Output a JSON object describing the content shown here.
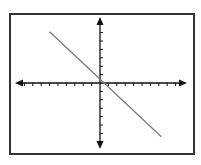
{
  "chart_data": {
    "type": "line",
    "title": "",
    "xlabel": "",
    "ylabel": "",
    "xlim": [
      -10,
      10
    ],
    "ylim": [
      -7.5,
      7.5
    ],
    "grid": false,
    "axes_style": "centered coordinate axes with arrowheads and unit tick marks",
    "series": [
      {
        "name": "line",
        "x": [
          -6,
          7.3
        ],
        "y": [
          6.1,
          -6.4
        ],
        "color": "#777777"
      }
    ]
  },
  "colors": {
    "axis": "#111111",
    "line": "#777777",
    "frame": "#333333"
  }
}
